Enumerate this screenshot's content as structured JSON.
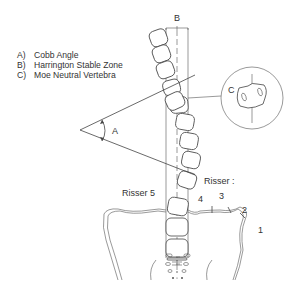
{
  "legend": {
    "items": [
      {
        "key": "A)",
        "label": "Cobb Angle"
      },
      {
        "key": "B)",
        "label": "Harrington Stable Zone"
      },
      {
        "key": "C)",
        "label": "Moe Neutral Vertebra"
      }
    ]
  },
  "labels": {
    "angle": "A",
    "zone": "B",
    "neutral": "C",
    "risser5": "Risser 5",
    "risser": "Risser :",
    "r4": "4",
    "r3": "3",
    "r2": "2",
    "r1": "1"
  }
}
